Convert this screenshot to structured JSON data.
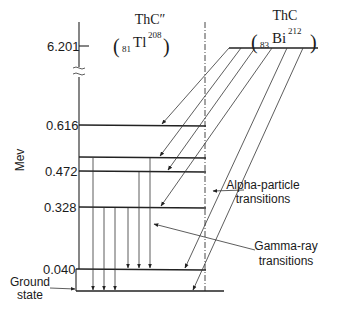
{
  "diagram": {
    "type": "nuclear-decay-energy-level-scheme",
    "axis": {
      "unit_label": "Mev",
      "ticks": [
        {
          "label": "6.201",
          "y": 46
        },
        {
          "label": "0.616",
          "y": 125
        },
        {
          "label": "0.472",
          "y": 171
        },
        {
          "label": "0.328",
          "y": 207
        },
        {
          "label": "0.040",
          "y": 269
        }
      ],
      "break_marks": "≈"
    },
    "daughter": {
      "name": "ThC″",
      "nuclide_open": "(",
      "Z": "81",
      "symbol": "Tl",
      "A": "208",
      "nuclide_close": ")"
    },
    "parent": {
      "name": "ThC",
      "nuclide_open": "(",
      "Z": "83",
      "symbol": "Bi",
      "A": "212",
      "nuclide_close": ")"
    },
    "levels": [
      {
        "energy": "0.616",
        "y": 125
      },
      {
        "energy": "",
        "y": 157
      },
      {
        "energy": "0.472",
        "y": 171
      },
      {
        "energy": "0.328",
        "y": 207
      },
      {
        "energy": "0.040",
        "y": 269
      },
      {
        "energy": "Ground state",
        "y": 291
      }
    ],
    "annotations": {
      "alpha": {
        "line1": "Alpha-particle",
        "line2": "transitions"
      },
      "gamma": {
        "line1": "Gamma-ray",
        "line2": "transitions"
      },
      "ground": {
        "line1": "Ground",
        "line2": "state"
      }
    }
  }
}
